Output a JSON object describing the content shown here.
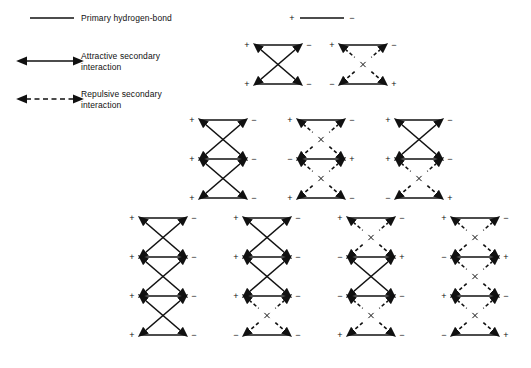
{
  "figure": {
    "background": "#ffffff",
    "line_color": "#111111",
    "title": ""
  },
  "legend": {
    "items": [
      {
        "key": "primary",
        "label": "Primary hydrogen-bond",
        "style": "solid-line",
        "arrowheads": "none"
      },
      {
        "key": "attractive",
        "label": "Attractive secondary\ninteraction",
        "style": "solid-line",
        "arrowheads": "both"
      },
      {
        "key": "repulsive",
        "label": "Repulsive secondary\ninteraction",
        "style": "dashed-line",
        "arrowheads": "both"
      }
    ],
    "unit_key": {
      "left_sign": "+",
      "right_sign": "−",
      "style": "solid-line"
    }
  },
  "structures": [
    {
      "id": "s2a",
      "units": 2,
      "x": 255,
      "y": 45,
      "rows": [
        {
          "left": "+",
          "right": "−"
        },
        {
          "left": "+",
          "right": "−"
        }
      ],
      "gaps": [
        "attractive"
      ]
    },
    {
      "id": "s2b",
      "units": 2,
      "x": 340,
      "y": 45,
      "rows": [
        {
          "left": "+",
          "right": "−"
        },
        {
          "left": "−",
          "right": "+"
        }
      ],
      "gaps": [
        "repulsive"
      ]
    },
    {
      "id": "s3a",
      "units": 3,
      "x": 200,
      "y": 120,
      "rows": [
        {
          "left": "+",
          "right": "−"
        },
        {
          "left": "+",
          "right": "−"
        },
        {
          "left": "+",
          "right": "−"
        }
      ],
      "gaps": [
        "attractive",
        "attractive"
      ]
    },
    {
      "id": "s3b",
      "units": 3,
      "x": 298,
      "y": 120,
      "rows": [
        {
          "left": "+",
          "right": "−"
        },
        {
          "left": "−",
          "right": "+"
        },
        {
          "left": "+",
          "right": "−"
        }
      ],
      "gaps": [
        "repulsive",
        "repulsive"
      ]
    },
    {
      "id": "s3c",
      "units": 3,
      "x": 396,
      "y": 120,
      "rows": [
        {
          "left": "+",
          "right": "−"
        },
        {
          "left": "+",
          "right": "−"
        },
        {
          "left": "−",
          "right": "+"
        }
      ],
      "gaps": [
        "attractive",
        "repulsive"
      ]
    },
    {
      "id": "s4a",
      "units": 4,
      "x": 140,
      "y": 218,
      "rows": [
        {
          "left": "+",
          "right": "−"
        },
        {
          "left": "+",
          "right": "−"
        },
        {
          "left": "+",
          "right": "−"
        },
        {
          "left": "+",
          "right": "−"
        }
      ],
      "gaps": [
        "attractive",
        "attractive",
        "attractive"
      ]
    },
    {
      "id": "s4b",
      "units": 4,
      "x": 244,
      "y": 218,
      "rows": [
        {
          "left": "+",
          "right": "−"
        },
        {
          "left": "+",
          "right": "−"
        },
        {
          "left": "+",
          "right": "−"
        },
        {
          "left": "−",
          "right": "−"
        }
      ],
      "gaps": [
        "attractive",
        "attractive",
        "repulsive"
      ]
    },
    {
      "id": "s4c",
      "units": 4,
      "x": 348,
      "y": 218,
      "rows": [
        {
          "left": "+",
          "right": "−"
        },
        {
          "left": "−",
          "right": "+"
        },
        {
          "left": "−",
          "right": "−"
        },
        {
          "left": "+",
          "right": "−"
        }
      ],
      "gaps": [
        "repulsive",
        "attractive",
        "repulsive"
      ]
    },
    {
      "id": "s4d",
      "units": 4,
      "x": 452,
      "y": 218,
      "rows": [
        {
          "left": "+",
          "right": "−"
        },
        {
          "left": "−",
          "right": "+"
        },
        {
          "left": "+",
          "right": "−"
        },
        {
          "left": "−",
          "right": "+"
        }
      ],
      "gaps": [
        "repulsive",
        "repulsive",
        "repulsive"
      ]
    }
  ],
  "geometry": {
    "bond_length": 46,
    "row_spacing": 39,
    "sign_offset": 8
  }
}
